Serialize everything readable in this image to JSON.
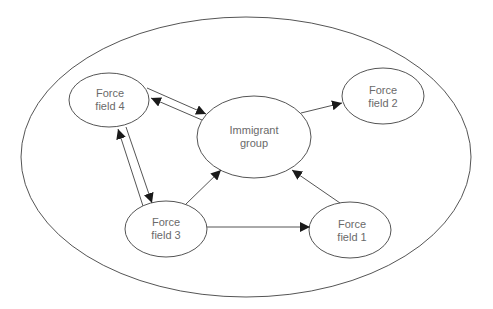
{
  "diagram": {
    "type": "force-field diagram",
    "container": {
      "shape": "ellipse",
      "cx": 246,
      "cy": 157,
      "rx": 225,
      "ry": 140
    },
    "colors": {
      "stroke": "#555555",
      "text": "#6a6a6a",
      "background": "#ffffff"
    },
    "nodes": [
      {
        "id": "immigrant",
        "line1": "Immigrant",
        "line2": "group",
        "cx": 254,
        "cy": 137,
        "rx": 57,
        "ry": 41
      },
      {
        "id": "ff1",
        "line1": "Force",
        "line2": "field 1",
        "cx": 350,
        "cy": 230,
        "rx": 41,
        "ry": 28
      },
      {
        "id": "ff2",
        "line1": "Force",
        "line2": "field 2",
        "cx": 383,
        "cy": 96,
        "rx": 41,
        "ry": 28
      },
      {
        "id": "ff3",
        "line1": "Force",
        "line2": "field 3",
        "cx": 166,
        "cy": 229,
        "rx": 41,
        "ry": 28
      },
      {
        "id": "ff4",
        "line1": "Force",
        "line2": "field 4",
        "cx": 109,
        "cy": 100,
        "rx": 40,
        "ry": 27
      }
    ],
    "edges": [
      {
        "from": "immigrant",
        "to": "ff2",
        "style": "single"
      },
      {
        "from": "ff3",
        "to": "immigrant",
        "style": "single"
      },
      {
        "from": "ff1",
        "to": "immigrant",
        "style": "single"
      },
      {
        "from": "ff3",
        "to": "ff1",
        "style": "single"
      },
      {
        "from": "ff4",
        "to": "immigrant",
        "style": "double-bidirectional"
      },
      {
        "from": "ff4",
        "to": "ff3",
        "style": "double-bidirectional"
      }
    ]
  }
}
